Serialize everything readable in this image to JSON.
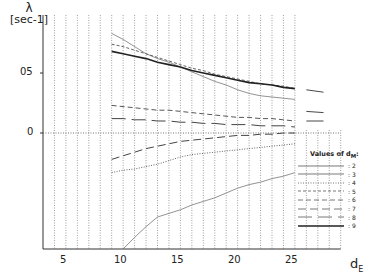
{
  "chart_data": {
    "type": "line",
    "title": "",
    "ylabel": "λ [sec⁻¹]",
    "xlabel": "d_E",
    "xlim": [
      3,
      30
    ],
    "ylim": [
      -0.097,
      0.098
    ],
    "x_ticks": [
      5,
      10,
      15,
      20,
      25
    ],
    "x_tick_labels": [
      "5",
      "10",
      "15",
      "20",
      "25"
    ],
    "y_ticks": [
      0,
      0.05
    ],
    "y_tick_labels": [
      "0",
      "05"
    ],
    "grid": "vertical dotted lines at each integer d_E; horizontal dotted line at λ=0",
    "legend_title": "Values of d_M:",
    "legend_position": "lower right",
    "x": [
      9,
      10,
      11,
      12,
      13,
      14,
      15,
      16,
      17,
      18,
      19,
      20,
      21,
      22,
      23,
      24,
      25
    ],
    "series": [
      {
        "name": "2",
        "style": "solid-thin",
        "values": [
          null,
          -0.097,
          -0.087,
          -0.078,
          -0.07,
          -0.067,
          -0.064,
          -0.06,
          -0.057,
          -0.054,
          -0.05,
          -0.046,
          -0.043,
          -0.041,
          -0.038,
          -0.036,
          -0.033
        ]
      },
      {
        "name": "3",
        "style": "solid-thin",
        "values": [
          0.083,
          0.078,
          0.072,
          0.066,
          0.062,
          0.059,
          0.055,
          0.051,
          0.047,
          0.043,
          0.04,
          0.036,
          0.033,
          0.031,
          0.03,
          0.029,
          0.028
        ]
      },
      {
        "name": "4",
        "style": "dotted",
        "values": [
          -0.033,
          -0.031,
          -0.03,
          -0.028,
          -0.026,
          -0.023,
          -0.02,
          -0.018,
          -0.017,
          -0.016,
          -0.015,
          -0.014,
          -0.013,
          -0.012,
          -0.011,
          -0.01,
          -0.009
        ]
      },
      {
        "name": "5",
        "style": "dashed-short",
        "values": [
          0.074,
          0.072,
          0.069,
          0.066,
          0.063,
          0.06,
          0.057,
          0.054,
          0.052,
          0.049,
          0.047,
          0.045,
          0.043,
          0.041,
          0.04,
          0.039,
          0.037
        ]
      },
      {
        "name": "6",
        "style": "dashed",
        "values": [
          0.023,
          0.022,
          0.021,
          0.02,
          0.019,
          0.019,
          0.018,
          0.017,
          0.016,
          0.015,
          0.014,
          0.013,
          0.013,
          0.012,
          0.012,
          0.011,
          0.01
        ]
      },
      {
        "name": "7",
        "style": "dash-long",
        "values": [
          -0.022,
          -0.019,
          -0.016,
          -0.013,
          -0.011,
          -0.009,
          -0.007,
          -0.006,
          -0.005,
          -0.004,
          -0.003,
          -0.002,
          -0.002,
          -0.001,
          -0.001,
          0.0,
          0.0
        ]
      },
      {
        "name": "8",
        "style": "dash-dot-long",
        "values": [
          0.012,
          0.012,
          0.011,
          0.011,
          0.01,
          0.01,
          0.009,
          0.009,
          0.008,
          0.008,
          0.007,
          0.007,
          0.007,
          0.006,
          0.006,
          0.006,
          0.005
        ]
      },
      {
        "name": "9",
        "style": "solid-thick",
        "values": [
          0.068,
          0.066,
          0.064,
          0.062,
          0.059,
          0.057,
          0.055,
          0.052,
          0.05,
          0.048,
          0.046,
          0.044,
          0.042,
          0.041,
          0.04,
          0.038,
          0.037
        ]
      }
    ],
    "extra_segments_beyond_25": [
      {
        "x": [
          26,
          27.5
        ],
        "values": [
          0.036,
          0.034
        ]
      },
      {
        "x": [
          26,
          27.5
        ],
        "values": [
          0.018,
          0.017
        ]
      },
      {
        "x": [
          26,
          27.5
        ],
        "values": [
          0.01,
          0.01
        ]
      }
    ]
  },
  "axis": {
    "ylabel_symbol": "λ",
    "ylabel_unit": "[sec-1]",
    "xlabel_main": "d",
    "xlabel_sub": "E",
    "y_ticks": [
      {
        "label": "05",
        "value": 0.05
      },
      {
        "label": "0",
        "value": 0
      }
    ],
    "x_ticks": [
      {
        "label": "5",
        "value": 5
      },
      {
        "label": "10",
        "value": 10
      },
      {
        "label": "15",
        "value": 15
      },
      {
        "label": "20",
        "value": 20
      },
      {
        "label": "25",
        "value": 25
      }
    ]
  },
  "legend": {
    "title": "Values of d",
    "title_sub": "M",
    "entries": [
      {
        "label": ": 2",
        "dash": ""
      },
      {
        "label": ": 3",
        "dash": ""
      },
      {
        "label": ": 4",
        "dash": "1,1.5"
      },
      {
        "label": ": 5",
        "dash": "3,2"
      },
      {
        "label": ": 6",
        "dash": "5,3"
      },
      {
        "label": ": 7",
        "dash": "8,4"
      },
      {
        "label": ": 8",
        "dash": "14,6"
      },
      {
        "label": ": 9",
        "dash": ""
      }
    ]
  }
}
